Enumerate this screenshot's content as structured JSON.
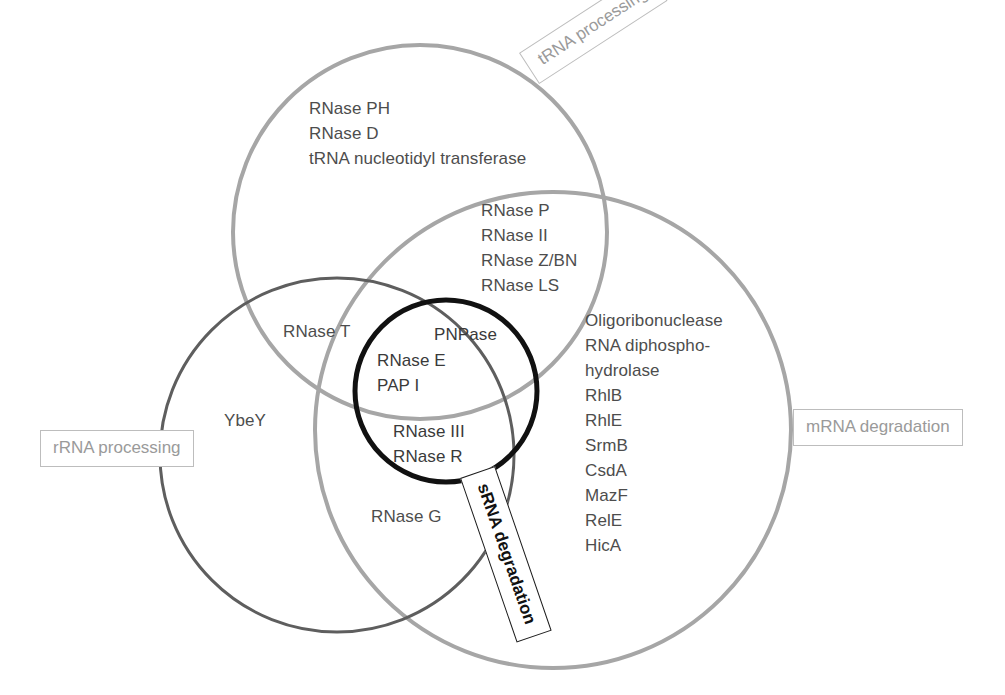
{
  "figure": {
    "type": "venn-diagram",
    "background": "#ffffff"
  },
  "categories": [
    {
      "id": "trna",
      "label": "tRNA processing",
      "color": "#9a9a9a",
      "border": "#bdbdbd",
      "rotation": -33
    },
    {
      "id": "rrna",
      "label": "rRNA processing",
      "color": "#9a9a9a",
      "border": "#bdbdbd",
      "rotation": 0
    },
    {
      "id": "mrna",
      "label": "mRNA degradation",
      "color": "#9a9a9a",
      "border": "#bdbdbd",
      "rotation": 0
    },
    {
      "id": "srna",
      "label": "sRNA degradation",
      "color": "#111111",
      "border": "#1c1c1c",
      "rotation": 71
    }
  ],
  "circles": {
    "trna": {
      "cx": 420,
      "cy": 232,
      "r": 187,
      "stroke": "#a6a6a6",
      "width": 4
    },
    "rrna": {
      "cx": 337,
      "cy": 455,
      "r": 177,
      "stroke": "#5e5e5e",
      "width": 3
    },
    "mrna": {
      "cx": 553,
      "cy": 430,
      "r": 238,
      "stroke": "#a6a6a6",
      "width": 4
    },
    "srna": {
      "cx": 446,
      "cy": 391,
      "r": 91,
      "stroke": "#111111",
      "width": 5
    }
  },
  "regions": {
    "trna_only": {
      "name": "tRNA processing only",
      "items": [
        "RNase PH",
        "RNase D",
        "tRNA nucleotidyl transferase"
      ],
      "text": "RNase PH\nRNase D\ntRNA nucleotidyl transferase"
    },
    "trna_mrna": {
      "name": "tRNA processing and mRNA degradation",
      "items": [
        "RNase P",
        "RNase II",
        "RNase Z/BN",
        "RNase LS"
      ],
      "text": "RNase P\nRNase II\nRNase Z/BN\nRNase LS"
    },
    "mrna_only": {
      "name": "mRNA degradation only",
      "items": [
        "Oligoribonuclease",
        "RNA diphospho-",
        "hydrolase",
        "RhlB",
        "RhlE",
        "SrmB",
        "CsdA",
        "MazF",
        "RelE",
        "HicA"
      ],
      "text": "Oligoribonuclease\nRNA diphospho-\nhydrolase\nRhlB\nRhlE\nSrmB\nCsdA\nMazF\nRelE\nHicA"
    },
    "rrna_trna": {
      "name": "rRNA and tRNA processing",
      "items": [
        "RNase T"
      ],
      "text": "RNase T"
    },
    "rrna_only": {
      "name": "rRNA processing only",
      "items": [
        "YbeY"
      ],
      "text": "YbeY"
    },
    "rrna_mrna": {
      "name": "rRNA processing and mRNA degradation",
      "items": [
        "RNase G"
      ],
      "text": "RNase G"
    },
    "srna_top": {
      "name": "sRNA degradation with tRNA and mRNA",
      "items": [
        "PNPase"
      ],
      "text": "PNPase"
    },
    "srna_left": {
      "name": "sRNA degradation with rRNA and mRNA",
      "items": [
        "RNase E",
        "PAP I"
      ],
      "text": "RNase E\nPAP I"
    },
    "srna_bottom": {
      "name": "sRNA degradation with mRNA",
      "items": [
        "RNase III",
        "RNase R"
      ],
      "text": "RNase III\nRNase R"
    }
  }
}
